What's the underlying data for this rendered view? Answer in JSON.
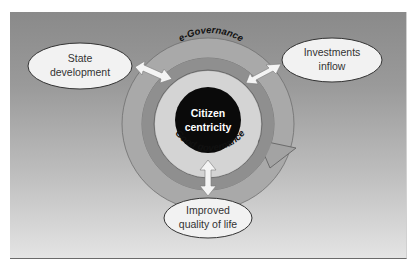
{
  "diagram": {
    "center": {
      "line1": "Citizen",
      "line2": "centricity"
    },
    "rings": {
      "outer_label": "e-Governance",
      "inner_label": "Good governance"
    },
    "nodes": {
      "state": {
        "line1": "State",
        "line2": "development"
      },
      "investments": {
        "line1": "Investments",
        "line2": "inflow"
      },
      "quality": {
        "line1": "Improved",
        "line2": "quality of life"
      }
    },
    "colors": {
      "background_top": "#8a8a8a",
      "background_bottom": "#e4e4e4",
      "outer_ring": "#a8a8a8",
      "middle_ring": "#8e8e8e",
      "inner_disc": "#d4d4d4",
      "center_disc": "#0a0a0a",
      "node_fill": "#f2f2f2",
      "arrow_fill": "#f4f4f4"
    }
  }
}
